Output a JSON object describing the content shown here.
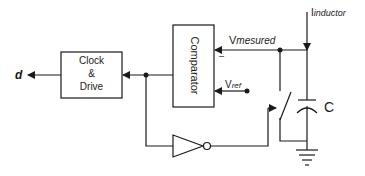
{
  "diagram": {
    "type": "circuit-schematic",
    "blocks": {
      "clock_drive": {
        "line1": "Clock",
        "line2": "&",
        "line3": "Drive"
      },
      "comparator": {
        "label": "Comparator"
      }
    },
    "labels": {
      "output": "d",
      "v_measured_main": "V",
      "v_measured_sub": "mesured",
      "v_ref_main": "V",
      "v_ref_sub": "ref",
      "i_inductor_main": "I",
      "i_inductor_sub": "inductor",
      "capacitor": "C",
      "minus_sign": "–"
    },
    "colors": {
      "stroke": "#1a1a1a",
      "background": "#ffffff"
    }
  }
}
